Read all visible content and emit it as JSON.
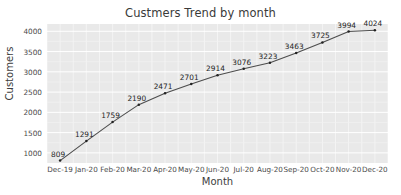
{
  "chart_data": {
    "type": "line",
    "title": "Custmers Trend by month",
    "xlabel": "Month",
    "ylabel": "Customers",
    "categories": [
      "Dec-19",
      "Jan-20",
      "Feb-20",
      "Mar-20",
      "Apr-20",
      "May-20",
      "Jun-20",
      "Jul-20",
      "Aug-20",
      "Sep-20",
      "Oct-20",
      "Nov-20",
      "Dec-20"
    ],
    "values": [
      809,
      1291,
      1759,
      2190,
      2471,
      2701,
      2914,
      3076,
      3223,
      3463,
      3725,
      3994,
      4024
    ],
    "point_labels": [
      "809",
      "1291",
      "1759",
      "2190",
      "2471",
      "2701",
      "2914",
      "3076",
      "3223",
      "3463",
      "3725",
      "3994",
      "4024"
    ],
    "yticks": [
      1000,
      1500,
      2000,
      2500,
      3000,
      3500,
      4000
    ],
    "ytick_labels": [
      "1000",
      "1500",
      "2000",
      "2500",
      "3000",
      "3500",
      "4000"
    ],
    "ylim": [
      750,
      4180
    ],
    "grid": true,
    "legend": false,
    "series": [
      {
        "name": "Customers",
        "values": [
          809,
          1291,
          1759,
          2190,
          2471,
          2701,
          2914,
          3076,
          3223,
          3463,
          3725,
          3994,
          4024
        ]
      }
    ],
    "colors": {
      "line": "#4d4d4d",
      "marker": "#222222",
      "plot_background": "#e9e9e9",
      "grid": "#f5f5f5",
      "figure_background": "#ffffff",
      "text": "#3d3d3d",
      "label_text": "#1f1f1f"
    }
  }
}
